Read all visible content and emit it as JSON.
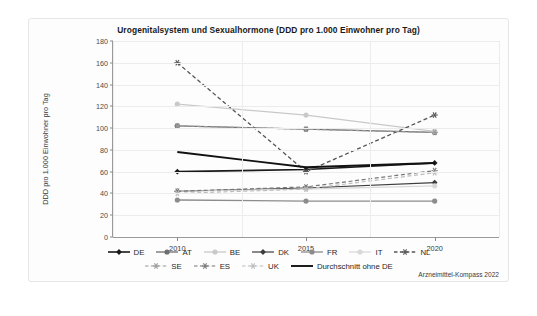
{
  "chart_data": {
    "type": "line",
    "title": "Urogenitalsystem und Sexualhormone (DDD pro 1.000 Einwohner pro Tag)",
    "xlabel": "",
    "ylabel": "DDD pro 1.000 Einwohner pro Tag",
    "categories": [
      "2010",
      "2015",
      "2020"
    ],
    "x": [
      2010,
      2015,
      2020
    ],
    "ylim": [
      0,
      180
    ],
    "yticks": [
      0,
      20,
      40,
      60,
      80,
      100,
      120,
      140,
      160,
      180
    ],
    "grid": true,
    "legend_position": "bottom",
    "series": [
      {
        "name": "DE",
        "values": [
          60,
          62,
          68
        ],
        "color": "#1a1a1a",
        "style": "solid",
        "marker": "diamond",
        "width": 1.6
      },
      {
        "name": "AT",
        "values": [
          102,
          99,
          96
        ],
        "color": "#6e6e6e",
        "style": "solid",
        "marker": "circle",
        "width": 1.3
      },
      {
        "name": "BE",
        "values": [
          122,
          112,
          97
        ],
        "color": "#c9c9c9",
        "style": "solid",
        "marker": "circle",
        "width": 1.3
      },
      {
        "name": "DK",
        "values": [
          42,
          45,
          50
        ],
        "color": "#3d3d3d",
        "style": "solid",
        "marker": "diamond",
        "width": 1.2
      },
      {
        "name": "FR",
        "values": [
          34,
          33,
          33
        ],
        "color": "#8c8c8c",
        "style": "solid",
        "marker": "circle",
        "width": 1.3
      },
      {
        "name": "IT",
        "values": [
          42,
          44,
          47
        ],
        "color": "#d8d8d8",
        "style": "solid",
        "marker": "circle",
        "width": 1.2
      },
      {
        "name": "NL",
        "values": [
          160,
          60,
          112
        ],
        "color": "#555555",
        "style": "dashed",
        "marker": "asterisk",
        "width": 1.3
      },
      {
        "name": "SE",
        "values": [
          102,
          99,
          96
        ],
        "color": "#9a9a9a",
        "style": "dashed",
        "marker": "asterisk",
        "width": 1.2
      },
      {
        "name": "ES",
        "values": [
          42,
          46,
          61
        ],
        "color": "#777777",
        "style": "dashed",
        "marker": "asterisk",
        "width": 1.2
      },
      {
        "name": "UK",
        "values": [
          40,
          44,
          59
        ],
        "color": "#bdbdbd",
        "style": "dashed",
        "marker": "asterisk",
        "width": 1.2
      },
      {
        "name": "Durchschnitt ohne DE",
        "values": [
          78,
          64,
          68
        ],
        "color": "#111111",
        "style": "solid",
        "marker": "none",
        "width": 1.9
      }
    ]
  },
  "source": {
    "text": "Arzneimittel-Kompass 2022"
  }
}
